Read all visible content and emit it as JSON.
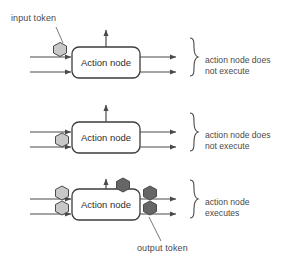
{
  "diagram": {
    "colors": {
      "stroke": "#4a4a4a",
      "box_stroke": "#3c3c3c",
      "box_fill": "#ffffff",
      "token_input": "#c8c8c8",
      "token_output": "#666666",
      "token_stroke": "#4a4a4a",
      "text": "#4a4a4a",
      "background": "#ffffff"
    },
    "annotations": {
      "input_token_label": "input token",
      "output_token_label": "output token"
    },
    "rows": [
      {
        "id": "row-1",
        "node_label": "Action node",
        "outcome_label": "action node does\nnot execute",
        "input_tokens": 1,
        "output_tokens": 0,
        "token_shade": "input"
      },
      {
        "id": "row-2",
        "node_label": "Action node",
        "outcome_label": "action node does\nnot execute",
        "input_tokens": 1,
        "output_tokens": 0,
        "token_shade": "input"
      },
      {
        "id": "row-3",
        "node_label": "Action node",
        "outcome_label": "action node\nexecutes",
        "input_tokens": 2,
        "output_tokens": 3,
        "token_shade": "both"
      }
    ]
  }
}
